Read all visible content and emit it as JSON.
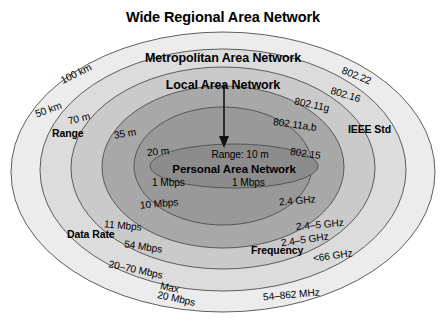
{
  "diagram": {
    "type": "concentric-ellipse-venn",
    "tiers": [
      {
        "id": "wran",
        "title": "Wide Regional Area Network",
        "range": "100 km",
        "ieee_std": "802.22",
        "data_rate_line1": "Max",
        "data_rate_line2": "20 Mbps",
        "frequency": "54–862 MHz",
        "fill": "#ececec"
      },
      {
        "id": "man",
        "title": "Metropolitan Area Network",
        "range": "50 km",
        "ieee_std": "802.16",
        "data_rate": "20–70 Mbps",
        "frequency": "<66 GHz",
        "fill": "#dcdcdc"
      },
      {
        "id": "lan-g",
        "title": "Local Area Network",
        "range": "70 m",
        "ieee_std": "802.11g",
        "data_rate": "54 Mbps",
        "frequency": "2.4–5 GHz",
        "fill": "#cacaca"
      },
      {
        "id": "lan-ab",
        "title": "",
        "range": "35 m",
        "ieee_std": "802.11a,b",
        "data_rate": "11 Mbps",
        "frequency": "2.4–5 GHz",
        "fill": "#a8a8a8"
      },
      {
        "id": "lan-inner",
        "title": "",
        "range": "20 m",
        "ieee_std": "",
        "data_rate": "10 Mbps",
        "frequency": "2.4 GHz",
        "fill": "#999999"
      },
      {
        "id": "pan",
        "title": "Personal Area Network",
        "range_label": "Range: 10 m",
        "ieee_std": "802.15",
        "data_rate": "1 Mbps",
        "frequency": "2.4 GHz",
        "fill": "#8c8c8c"
      }
    ],
    "axis_labels": {
      "range": "Range",
      "data_rate": "Data Rate",
      "ieee_std": "IEEE Std",
      "frequency": "Frequency"
    },
    "arrow": {
      "name": "pointer-arrow",
      "from": "Local Area Network",
      "to": "Personal Area Network"
    },
    "colors": {
      "stroke": "#4d4d4d",
      "text": "#000000",
      "background": "#ffffff"
    }
  }
}
